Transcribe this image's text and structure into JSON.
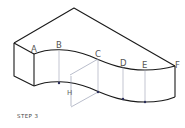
{
  "figure": {
    "points": [
      "A",
      "B",
      "C",
      "D",
      "E",
      "F"
    ],
    "dimension_label": "H",
    "caption": "STEP 3"
  }
}
